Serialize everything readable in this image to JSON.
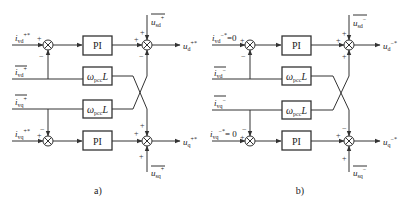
{
  "panels": [
    {
      "caption": "a)",
      "inputs": {
        "id_ref": {
          "base": "i",
          "sub": "vd",
          "sup": "+*",
          "suffix": ""
        },
        "id_fb": {
          "base": "i",
          "sub": "vd",
          "sup": "+",
          "overline": true
        },
        "iq_fb": {
          "base": "i",
          "sub": "vq",
          "sup": "+",
          "overline": true
        },
        "iq_ref": {
          "base": "i",
          "sub": "vq",
          "sup": "+*",
          "suffix": ""
        }
      },
      "blocks": {
        "pi_top": "PI",
        "wl_top": "ω",
        "wl_top_sub": "pcc",
        "wl_top_L": "L",
        "wl_bot": "ω",
        "wl_bot_sub": "pcc",
        "wl_bot_L": "L",
        "pi_bot": "PI"
      },
      "feedforward": {
        "usd": {
          "base": "u",
          "sub": "sd",
          "sup": "+",
          "overline": true
        },
        "usq": {
          "base": "u",
          "sub": "sq",
          "sup": "+",
          "overline": true
        }
      },
      "outputs": {
        "ud": {
          "base": "u",
          "sub": "d",
          "sup": "+*"
        },
        "uq": {
          "base": "u",
          "sub": "q",
          "sup": "+*"
        }
      },
      "signs": {
        "left_top_in": "+",
        "left_top_fb": "−",
        "right_top_pi": "+",
        "right_top_ff": "+",
        "right_top_cross": "−",
        "left_bot_in": "+",
        "left_bot_fb": "−",
        "right_bot_pi": "+",
        "right_bot_cross": "+",
        "right_bot_ff": "+"
      }
    },
    {
      "caption": "b)",
      "inputs": {
        "id_ref": {
          "base": "i",
          "sub": "vd",
          "sup": "−*",
          "suffix": "=0"
        },
        "id_fb": {
          "base": "i",
          "sub": "vd",
          "sup": "−",
          "overline": true
        },
        "iq_fb": {
          "base": "i",
          "sub": "vq",
          "sup": "−",
          "overline": true
        },
        "iq_ref": {
          "base": "i",
          "sub": "vq",
          "sup": "−*",
          "suffix": "= 0"
        }
      },
      "blocks": {
        "pi_top": "PI",
        "wl_top": "ω",
        "wl_top_sub": "pcc",
        "wl_top_L": "L",
        "wl_bot": "ω",
        "wl_bot_sub": "pcc",
        "wl_bot_L": "L",
        "pi_bot": "PI"
      },
      "feedforward": {
        "usd": {
          "base": "u",
          "sub": "sd",
          "sup": "−",
          "overline": true
        },
        "usq": {
          "base": "u",
          "sub": "sq",
          "sup": "−",
          "overline": true
        }
      },
      "outputs": {
        "ud": {
          "base": "u",
          "sub": "d",
          "sup": "−*"
        },
        "uq": {
          "base": "u",
          "sub": "q",
          "sup": "−*"
        }
      },
      "signs": {
        "left_top_in": "+",
        "left_top_fb": "−",
        "right_top_pi": "+",
        "right_top_ff": "+",
        "right_top_cross": "+",
        "left_bot_in": "+",
        "left_bot_fb": "−",
        "right_bot_pi": "+",
        "right_bot_cross": "−",
        "right_bot_ff": "+"
      }
    }
  ]
}
